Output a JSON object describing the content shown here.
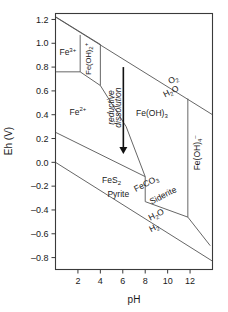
{
  "chart_data": {
    "type": "line",
    "title": "",
    "xlabel": "pH",
    "ylabel": "Eh (V)",
    "xlim": [
      0,
      14
    ],
    "ylim": [
      -0.9,
      1.25
    ],
    "xticks": [
      2,
      4,
      6,
      8,
      10,
      12
    ],
    "yticks": [
      1.2,
      1.0,
      0.8,
      0.6,
      0.4,
      0.2,
      0.0,
      -0.2,
      -0.4,
      -0.6,
      -0.8
    ],
    "ytick_labels": [
      "1.2",
      "1.0",
      "0.8",
      "0.6",
      "0.4",
      "0.2",
      "0.0",
      "–0.2",
      "–0.4",
      "–0.6",
      "–0.8"
    ],
    "xtick_labels": [
      "2",
      "4",
      "6",
      "8",
      "10",
      "12"
    ],
    "grid": false,
    "legend": "none",
    "series": [
      {
        "name": "O2/H2O water upper stability limit",
        "points": [
          [
            0,
            1.22
          ],
          [
            14,
            0.4
          ]
        ]
      },
      {
        "name": "H2O/H2 water lower stability limit",
        "points": [
          [
            0,
            0.0
          ],
          [
            14,
            -0.83
          ]
        ]
      },
      {
        "name": "Fe3+ / Fe(OH)2+ vertical boundary",
        "points": [
          [
            2.2,
            1.07
          ],
          [
            2.2,
            0.76
          ]
        ]
      },
      {
        "name": "Fe3+ / Fe2+ horizontal boundary",
        "points": [
          [
            0.05,
            0.76
          ],
          [
            2.2,
            0.76
          ]
        ]
      },
      {
        "name": "Fe(OH)2+ / Fe(OH)3 vertical boundary",
        "points": [
          [
            4.0,
            0.99
          ],
          [
            4.0,
            0.645
          ]
        ]
      },
      {
        "name": "Fe3+ upper boundary to Fe(OH)2+",
        "points": [
          [
            0.05,
            1.22
          ],
          [
            4.0,
            0.99
          ]
        ]
      },
      {
        "name": "Fe2+ / Fe(OH)3 sloping boundary",
        "points": [
          [
            2.2,
            0.76
          ],
          [
            4.0,
            0.645
          ],
          [
            6.3,
            0.3
          ]
        ]
      },
      {
        "name": "Fe2+ / FeCO3 sloping boundary lower",
        "points": [
          [
            6.3,
            0.3
          ],
          [
            8.0,
            -0.12
          ]
        ]
      },
      {
        "name": "FeS2 Pyrite upper boundary",
        "points": [
          [
            0.05,
            0.25
          ],
          [
            8.0,
            -0.12
          ]
        ]
      },
      {
        "name": "FeS2 / FeCO3 vertical boundary",
        "points": [
          [
            8.0,
            -0.12
          ],
          [
            8.0,
            -0.33
          ]
        ]
      },
      {
        "name": "FeCO3 Siderite lower sloping boundary",
        "points": [
          [
            8.0,
            -0.33
          ],
          [
            11.8,
            -0.46
          ],
          [
            13.8,
            -0.7
          ]
        ]
      },
      {
        "name": "Fe(OH)3 / Fe(OH)4- vertical boundary",
        "points": [
          [
            11.8,
            0.535
          ],
          [
            11.8,
            -0.46
          ]
        ]
      }
    ],
    "region_labels": [
      {
        "id": "fe3",
        "base": "Fe",
        "sup": "3+",
        "sub": "",
        "x": 1.1,
        "y": 0.9,
        "rotation": 0,
        "size": "normal"
      },
      {
        "id": "fe-oh-2-plus",
        "base": "Fe(OH)",
        "sub": "2",
        "sup": "+",
        "x": 3.15,
        "y": 0.87,
        "rotation": -90,
        "size": "small"
      },
      {
        "id": "fe2",
        "base": "Fe",
        "sup": "2+",
        "sub": "",
        "x": 2.0,
        "y": 0.4,
        "rotation": 0,
        "size": "normal"
      },
      {
        "id": "fe-oh-3",
        "base": "Fe(OH)",
        "sub": "3",
        "sup": "",
        "x": 8.6,
        "y": 0.39,
        "rotation": 0,
        "size": "normal"
      },
      {
        "id": "fe-oh-4-minus",
        "base": "Fe(OH)",
        "sub": "4",
        "sup": "–",
        "x": 12.9,
        "y": 0.08,
        "rotation": -90,
        "size": "normal"
      },
      {
        "id": "fes2",
        "base": "FeS",
        "sub": "2",
        "sup": "",
        "x": 5.0,
        "y": -0.17,
        "rotation": 0,
        "size": "normal"
      },
      {
        "id": "pyrite",
        "base": "Pyrite",
        "sub": "",
        "sup": "",
        "x": 5.6,
        "y": -0.29,
        "rotation": 0,
        "size": "normal"
      },
      {
        "id": "feco3",
        "base": "FeCO",
        "sub": "3",
        "sup": "",
        "x": 8.2,
        "y": -0.2,
        "rotation": -27,
        "size": "normal"
      },
      {
        "id": "siderite",
        "base": "Siderite",
        "sub": "",
        "sup": "",
        "x": 9.7,
        "y": -0.3,
        "rotation": -27,
        "size": "normal"
      },
      {
        "id": "o2",
        "base": "O",
        "sub": "2",
        "sup": "",
        "x": 10.6,
        "y": 0.675,
        "rotation": -27,
        "size": "normal"
      },
      {
        "id": "h2o-upper",
        "base": "H",
        "sub": "2",
        "sup": "",
        "tail": "O",
        "x": 10.4,
        "y": 0.575,
        "rotation": -27,
        "size": "normal"
      },
      {
        "id": "h2o-lower",
        "base": "H",
        "sub": "2",
        "sup": "",
        "tail": "O",
        "x": 9.1,
        "y": -0.46,
        "rotation": -27,
        "size": "normal"
      },
      {
        "id": "h2-lower",
        "base": "H",
        "sub": "2",
        "sup": "",
        "x": 8.9,
        "y": -0.57,
        "rotation": -27,
        "size": "normal"
      }
    ],
    "annotations": [
      {
        "id": "reductive",
        "text": "reductive",
        "x": 5.25,
        "y": 0.46,
        "rotation": -90
      },
      {
        "id": "dissolution",
        "text": "dissolution",
        "x": 5.85,
        "y": 0.46,
        "rotation": -90
      }
    ],
    "arrow": {
      "id": "reductive-dissolution-arrow",
      "x": 6.05,
      "y_start": 0.8,
      "y_end": 0.07
    }
  },
  "colors": {
    "background": "#ffffff",
    "frame": "#3a3a3a",
    "boundary": "#555555",
    "text": "#1a1a1a",
    "arrow": "#111111"
  }
}
